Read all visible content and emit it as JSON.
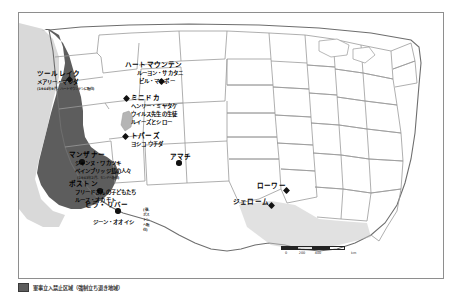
{
  "map": {
    "title": "第二次世界大戦 日系アメリカ人強制収容所 地図",
    "exclusion_zone_color": "#5d5d5d",
    "land_color": "#ffffff",
    "border_color": "#8e8e8e",
    "marker_color": "#111111"
  },
  "camps": [
    {
      "id": "tule-lake",
      "name": "ツールレイク",
      "people": [
        "メアリー・マツダ"
      ],
      "note": "(1944年9月、ハートマウンテンに転住)",
      "marker": "diamond"
    },
    {
      "id": "heart-mountain",
      "name": "ハートマウンテン",
      "people": [
        "ルーヨン・サカタニ",
        "ビル・マンボー"
      ],
      "note": "",
      "marker": "diamond"
    },
    {
      "id": "minidoka",
      "name": "ミニドカ",
      "people": [
        "ヘンリー・ミヤタケ",
        "ウイルス先生の生徒",
        "ルイーズとシロー"
      ],
      "note": "",
      "marker": "diamond"
    },
    {
      "id": "topaz",
      "name": "トパーズ",
      "people": [
        "ヨシコ ウチダ"
      ],
      "note": "",
      "marker": "diamond"
    },
    {
      "id": "manzanar",
      "name": "マンザナー",
      "people": [
        "ジャンヌ・ワカツキ",
        "ベインブリッジ島の人々"
      ],
      "note": "(1943年2月、モンドへ転住)",
      "marker": "dot"
    },
    {
      "id": "poston",
      "name": "ポストン",
      "people": [
        "フリードさんの子どもたち",
        "ルース・オカモト"
      ],
      "note": "",
      "marker": "dot"
    },
    {
      "id": "gila-river",
      "name": "ヒラ・リバー",
      "people": [
        "ジーン・オオイシ"
      ],
      "note": "(後、ポストンへ転住)",
      "marker": "dot"
    },
    {
      "id": "amache",
      "name": "アマチ",
      "people": [],
      "note": "",
      "marker": "dot"
    },
    {
      "id": "rohwer",
      "name": "ローワー",
      "people": [],
      "note": "",
      "marker": "diamond"
    },
    {
      "id": "jerome",
      "name": "ジェローム",
      "people": [],
      "note": "",
      "marker": "diamond"
    }
  ],
  "scale": {
    "ticks": [
      "0",
      "200",
      "400"
    ],
    "unit": "km"
  },
  "caption": {
    "legend_label": "軍事立入禁止区域（強制立ち退き地域）",
    "swatch_color": "#5d5d5d"
  }
}
